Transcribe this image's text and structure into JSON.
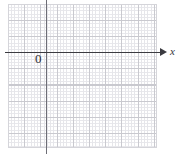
{
  "figure": {
    "type": "blank-cartesian-grid",
    "background_color": "#ffffff",
    "grid": {
      "major_color": "#c9c9cf",
      "minor_color": "#e6e6ea",
      "major_cell_px": 16,
      "minor_per_major": 5,
      "border_color": "#d5d5da"
    },
    "axes": {
      "x": {
        "label": "x",
        "color": "#3b3b40",
        "arrow": "right-arrowhead"
      },
      "y": {
        "label": "",
        "color": "#6e6e76",
        "arrow": "none"
      }
    },
    "origin_label": "0"
  },
  "chart_data": {
    "type": "scatter",
    "title": "",
    "subtitle": "",
    "xlabel": "x",
    "ylabel": "",
    "x": [],
    "y": [],
    "series": [],
    "annotations": [
      "0",
      "x"
    ],
    "xticklabels": [],
    "yticklabels": [],
    "grid": true,
    "legend": "none",
    "note": "Empty coordinate plane on graph paper; no data plotted."
  }
}
